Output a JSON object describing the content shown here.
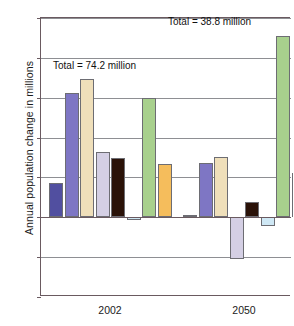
{
  "chart_data": {
    "type": "bar",
    "title": "",
    "xlabel": "",
    "ylabel": "Annual population change in millions",
    "ylim": [
      -10,
      25
    ],
    "yticks": [
      25,
      20,
      15,
      10,
      5,
      0,
      -5,
      -10
    ],
    "ytick_labels": [
      "25",
      "20",
      "15",
      "10",
      "5",
      "0",
      "-5",
      "-10"
    ],
    "grid": true,
    "legend": "none",
    "categories": [
      "2002",
      "2050"
    ],
    "series": [
      {
        "name": "series-1",
        "color": "#514fa0",
        "values": [
          4.3,
          0.3
        ]
      },
      {
        "name": "series-2",
        "color": "#7e76c4",
        "values": [
          15.6,
          6.8
        ]
      },
      {
        "name": "series-3",
        "color": "#efdfba",
        "values": [
          17.3,
          7.6
        ]
      },
      {
        "name": "series-4",
        "color": "#d4cfe4",
        "values": [
          8.2,
          -5.2
        ]
      },
      {
        "name": "series-5",
        "color": "#2a1208",
        "values": [
          7.5,
          1.9
        ]
      },
      {
        "name": "series-6",
        "color": "#cfe8f5",
        "values": [
          -0.3,
          -1.1
        ]
      },
      {
        "name": "series-7",
        "color": "#a8d08d",
        "values": [
          15.0,
          22.7
        ]
      },
      {
        "name": "series-8",
        "color": "#f5bd5c",
        "values": [
          6.7,
          5.6
        ]
      }
    ],
    "annotations": [
      {
        "text": "Total = 74.2 million",
        "group": "2002"
      },
      {
        "text": "Total = 38.8 million",
        "group": "2050"
      }
    ]
  },
  "axis": {
    "y_title": "Annual population change in millions",
    "y_labels": [
      "25",
      "20",
      "15",
      "10",
      "5",
      "0",
      "-5",
      "-10"
    ],
    "x_labels": [
      "2002",
      "2050"
    ]
  },
  "notes": {
    "total_2002": "Total = 74.2 million",
    "total_2050": "Total = 38.8 million"
  },
  "colors": {
    "axis": "#6a5a60",
    "grid": "#8e8f93",
    "bar_outline": "#6d6d73"
  }
}
